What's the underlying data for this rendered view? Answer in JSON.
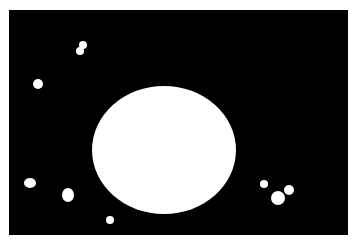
{
  "image": {
    "description": "binary segmentation mask: large white disc with small white blobs on black background",
    "background_color": "#000000",
    "foreground_color": "#ffffff",
    "border_color": "#ffffff",
    "mask_rect": {
      "x": 9,
      "y": 10,
      "w": 339,
      "h": 225
    },
    "shapes": [
      {
        "name": "large-disc",
        "cx": 164,
        "cy": 150,
        "rx": 72,
        "ry": 64
      },
      {
        "name": "blob-top-a",
        "cx": 83,
        "cy": 45,
        "rx": 4,
        "ry": 4
      },
      {
        "name": "blob-top-b",
        "cx": 80,
        "cy": 51,
        "rx": 4,
        "ry": 4
      },
      {
        "name": "blob-left",
        "cx": 38,
        "cy": 84,
        "rx": 5,
        "ry": 5
      },
      {
        "name": "blob-bottom-left",
        "cx": 30,
        "cy": 183,
        "rx": 6,
        "ry": 5
      },
      {
        "name": "blob-bottom-mid",
        "cx": 68,
        "cy": 195,
        "rx": 6,
        "ry": 7
      },
      {
        "name": "blob-bottom-small",
        "cx": 110,
        "cy": 220,
        "rx": 4,
        "ry": 4
      },
      {
        "name": "blob-right-small",
        "cx": 264,
        "cy": 184,
        "rx": 4,
        "ry": 4
      },
      {
        "name": "blob-right-a",
        "cx": 278,
        "cy": 198,
        "rx": 7,
        "ry": 7
      },
      {
        "name": "blob-right-b",
        "cx": 289,
        "cy": 190,
        "rx": 5,
        "ry": 5
      }
    ]
  }
}
